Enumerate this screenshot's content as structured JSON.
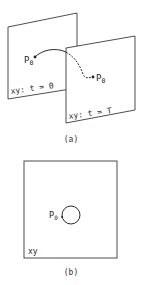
{
  "figure_a": {
    "caption": "(a)",
    "panel_front": {
      "label": "xy:  t = 0"
    },
    "panel_back": {
      "label": "xy:  t = T"
    },
    "start_point": {
      "label": "P",
      "subscript": "0"
    },
    "end_point": {
      "label": "P",
      "subscript": "0"
    }
  },
  "figure_b": {
    "caption": "(b)",
    "panel": {
      "label": "xy"
    },
    "point": {
      "label": "P",
      "subscript": "0"
    }
  },
  "colors": {
    "stroke": "#3a3a3a",
    "background": "#ffffff"
  }
}
